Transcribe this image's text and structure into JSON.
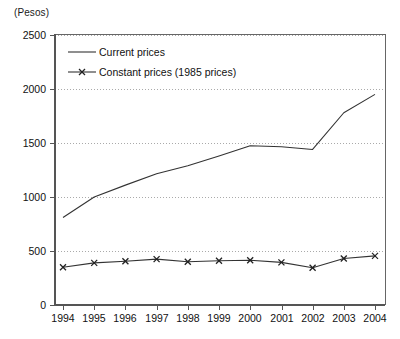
{
  "unit_label": "(Pesos)",
  "chart_data": {
    "type": "line",
    "title": "",
    "xlabel": "",
    "ylabel": "(Pesos)",
    "ylim": [
      0,
      2500
    ],
    "yticks": [
      0,
      500,
      1000,
      1500,
      2000,
      2500
    ],
    "ytick_labels": [
      "0",
      "500",
      "1000",
      "1500",
      "2000",
      "2500"
    ],
    "grid": "horizontal-dotted",
    "legend_position": "top-left-inside",
    "categories": [
      "1994",
      "1995",
      "1996",
      "1997",
      "1998",
      "1999",
      "2000",
      "2001",
      "2002",
      "2003",
      "2004"
    ],
    "x": [
      1994,
      1995,
      1996,
      1997,
      1998,
      1999,
      2000,
      2001,
      2002,
      2003,
      2004
    ],
    "series": [
      {
        "name": "Current prices",
        "marker": "none",
        "color": "#333333",
        "values": [
          810,
          1000,
          1110,
          1215,
          1290,
          1380,
          1475,
          1465,
          1440,
          1780,
          1950
        ]
      },
      {
        "name": "Constant prices (1985 prices)",
        "marker": "x",
        "color": "#333333",
        "values": [
          350,
          390,
          405,
          425,
          400,
          410,
          415,
          395,
          345,
          430,
          455
        ]
      }
    ]
  },
  "legend": {
    "items": [
      {
        "label": "Current prices",
        "marker": "line"
      },
      {
        "label": "Constant prices (1985 prices)",
        "marker": "line-x"
      }
    ]
  },
  "colors": {
    "line": "#333333",
    "axis": "#555555",
    "grid": "#aaaaaa",
    "text": "#111111",
    "background": "#ffffff"
  }
}
